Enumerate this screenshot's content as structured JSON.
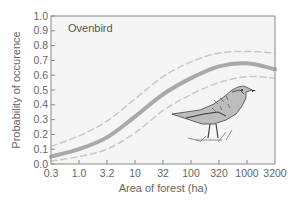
{
  "chart_data": {
    "type": "line",
    "title": "Ovenbird",
    "xlabel": "Area of forest (ha)",
    "ylabel": "Probability of occurence",
    "x_scale": "log",
    "x": [
      0.3,
      1.0,
      3.2,
      10,
      32,
      100,
      320,
      1000,
      3200
    ],
    "x_tick_labels": [
      "0.3",
      "1.0",
      "3.2",
      "10",
      "32",
      "100",
      "320",
      "1000",
      "3200"
    ],
    "y_tick_labels": [
      "0.0",
      "0.1",
      "0.2",
      "0.3",
      "0.4",
      "0.5",
      "0.6",
      "0.7",
      "0.8",
      "0.9",
      "1.0"
    ],
    "ylim": [
      0.0,
      1.0
    ],
    "grid": false,
    "series": [
      {
        "name": "Probability of occurence",
        "style": "solid",
        "color": "#a9a9a9",
        "values": [
          0.05,
          0.1,
          0.18,
          0.32,
          0.47,
          0.58,
          0.66,
          0.68,
          0.64
        ]
      },
      {
        "name": "Upper confidence bound",
        "style": "dashed",
        "color": "#c8c8c8",
        "values": [
          0.12,
          0.19,
          0.29,
          0.44,
          0.59,
          0.69,
          0.75,
          0.76,
          0.75
        ]
      },
      {
        "name": "Lower confidence bound",
        "style": "dashed",
        "color": "#c8c8c8",
        "values": [
          0.02,
          0.05,
          0.1,
          0.21,
          0.36,
          0.47,
          0.55,
          0.59,
          0.58
        ]
      }
    ],
    "annotations": [
      "Ovenbird",
      "bird illustration"
    ]
  },
  "labels": {
    "species": "Ovenbird",
    "xlabel": "Area of forest (ha)",
    "ylabel": "Probability of occurence"
  },
  "colors": {
    "plot_bg": "#f5f5f5",
    "frame": "#8a8a8a",
    "main_curve": "#a9a9a9",
    "ci_curve": "#c8c8c8"
  }
}
